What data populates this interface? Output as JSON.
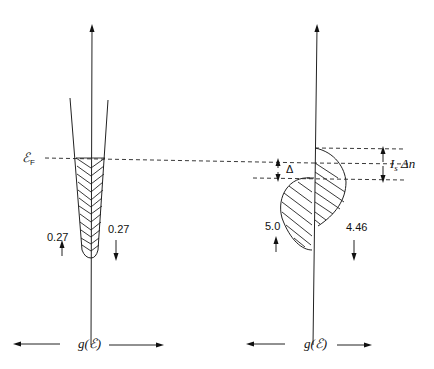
{
  "diagram": {
    "left_panel": {
      "fermi_label": "ℰ",
      "fermi_subscript": "F",
      "up_value": "0.27",
      "down_value": "0.27",
      "axis_label": "g(ℰ)"
    },
    "right_panel": {
      "delta_label": "Δ",
      "exchange_label_I": "I",
      "exchange_label_sub": "s",
      "exchange_label_rest": " Δn",
      "up_value": "5.0",
      "down_value": "4.46",
      "axis_label": "g(ℰ)"
    }
  }
}
